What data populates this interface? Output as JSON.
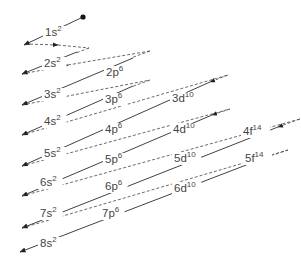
{
  "diagram": {
    "start_point": {
      "x": 83,
      "y": 17
    },
    "orbitals": [
      {
        "label": "1s",
        "electrons": "2",
        "x": 45,
        "y": 36
      },
      {
        "label": "2s",
        "electrons": "2",
        "x": 44,
        "y": 67
      },
      {
        "label": "2p",
        "electrons": "6",
        "x": 106,
        "y": 76
      },
      {
        "label": "3s",
        "electrons": "2",
        "x": 44,
        "y": 98
      },
      {
        "label": "3p",
        "electrons": "6",
        "x": 105,
        "y": 103
      },
      {
        "label": "3d",
        "electrons": "10",
        "x": 172,
        "y": 102
      },
      {
        "label": "4s",
        "electrons": "2",
        "x": 44,
        "y": 125
      },
      {
        "label": "4p",
        "electrons": "6",
        "x": 105,
        "y": 133
      },
      {
        "label": "4d",
        "electrons": "10",
        "x": 173,
        "y": 133
      },
      {
        "label": "4f",
        "electrons": "14",
        "x": 243,
        "y": 135
      },
      {
        "label": "5s",
        "electrons": "2",
        "x": 44,
        "y": 157
      },
      {
        "label": "5p",
        "electrons": "6",
        "x": 105,
        "y": 163
      },
      {
        "label": "5d",
        "electrons": "10",
        "x": 174,
        "y": 162
      },
      {
        "label": "5f",
        "electrons": "14",
        "x": 245,
        "y": 162
      },
      {
        "label": "6s",
        "electrons": "2",
        "x": 40,
        "y": 186
      },
      {
        "label": "6p",
        "electrons": "6",
        "x": 105,
        "y": 190
      },
      {
        "label": "6d",
        "electrons": "10",
        "x": 174,
        "y": 192
      },
      {
        "label": "7s",
        "electrons": "2",
        "x": 40,
        "y": 217
      },
      {
        "label": "7p",
        "electrons": "6",
        "x": 102,
        "y": 217
      },
      {
        "label": "8s",
        "electrons": "2",
        "x": 40,
        "y": 247
      }
    ]
  }
}
